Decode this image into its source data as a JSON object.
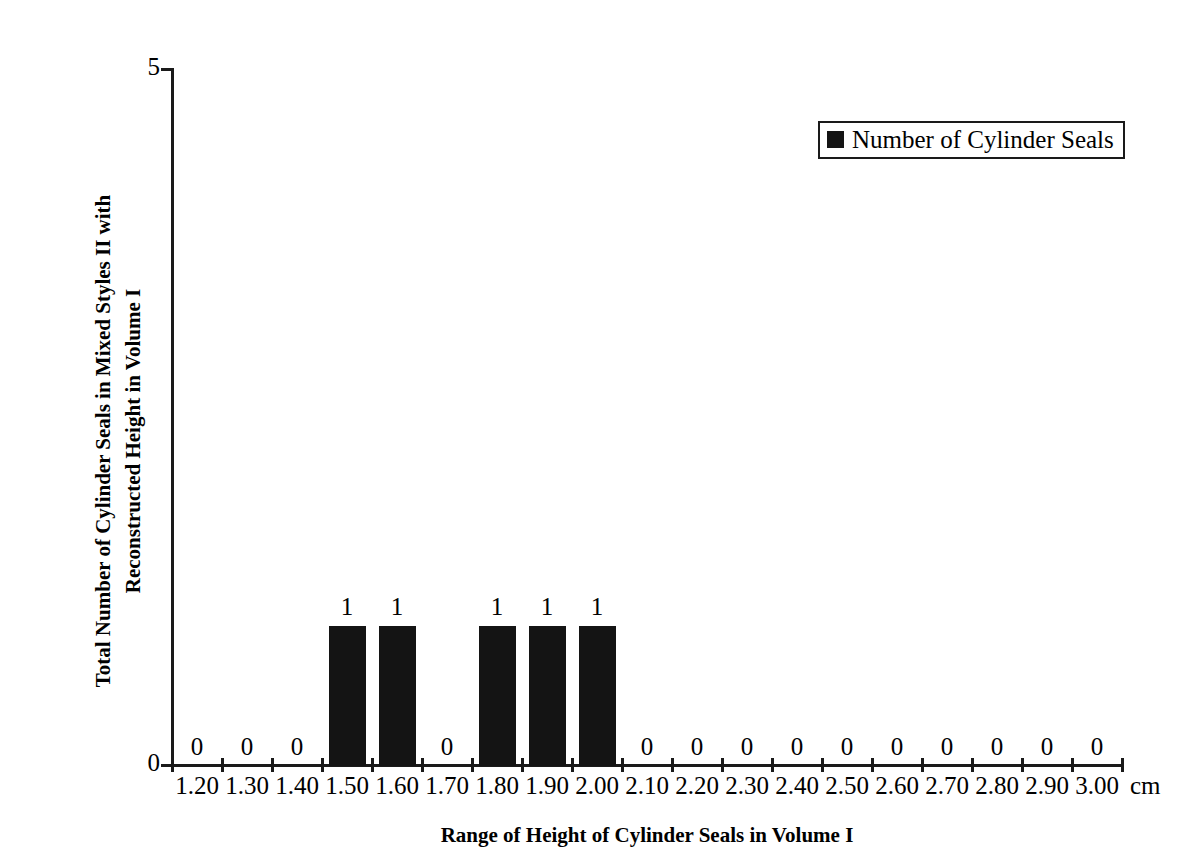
{
  "chart_data": {
    "type": "bar",
    "title": "",
    "xlabel": "Range of Height of Cylinder Seals in Volume I",
    "ylabel_line1": "Total Number of Cylinder Seals in Mixed Styles II with",
    "ylabel_line2": "Reconstructed Height in Volume I",
    "x_unit": "cm",
    "categories": [
      "1.20",
      "1.30",
      "1.40",
      "1.50",
      "1.60",
      "1.70",
      "1.80",
      "1.90",
      "2.00",
      "2.10",
      "2.20",
      "2.30",
      "2.40",
      "2.50",
      "2.60",
      "2.70",
      "2.80",
      "2.90",
      "3.00"
    ],
    "values": [
      0,
      0,
      0,
      1,
      1,
      0,
      1,
      1,
      1,
      0,
      0,
      0,
      0,
      0,
      0,
      0,
      0,
      0,
      0
    ],
    "data_labels": [
      "0",
      "0",
      "0",
      "1",
      "1",
      "0",
      "1",
      "1",
      "1",
      "0",
      "0",
      "0",
      "0",
      "0",
      "0",
      "0",
      "0",
      "0",
      "0"
    ],
    "ylim": [
      0,
      5
    ],
    "y_ticks": [
      "0",
      "5"
    ],
    "grid": false,
    "legend": {
      "position": "top-right",
      "entries": [
        {
          "label": "Number of Cylinder Seals",
          "color": "#141414"
        }
      ]
    },
    "series": [
      {
        "name": "Number of Cylinder Seals",
        "values": [
          0,
          0,
          0,
          1,
          1,
          0,
          1,
          1,
          1,
          0,
          0,
          0,
          0,
          0,
          0,
          0,
          0,
          0,
          0
        ]
      }
    ]
  },
  "colors": {
    "bar": "#141414",
    "axis": "#1a1a1a",
    "background": "#ffffff",
    "text": "#000000"
  }
}
